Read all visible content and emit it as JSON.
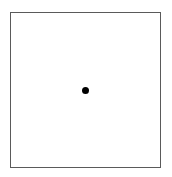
{
  "diagram": {
    "frame": {
      "shape": "square",
      "border_color": "#5a5a5a",
      "fill_color": "#ffffff"
    },
    "points": [
      {
        "label": "",
        "shape": "filled-circle",
        "color": "#000000",
        "center_x": 85,
        "center_y": 90
      }
    ]
  }
}
